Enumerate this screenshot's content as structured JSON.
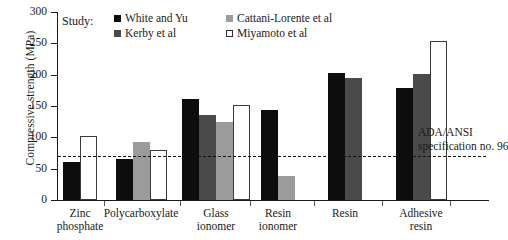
{
  "chart_data": {
    "type": "bar",
    "title": "",
    "xlabel": "",
    "ylabel": "Compressive strength (MPa)",
    "ylim": [
      0,
      300
    ],
    "yticks": [
      0,
      50,
      100,
      150,
      200,
      250,
      300
    ],
    "grid": false,
    "legend_position": "top-left-inside",
    "legend_title": "Study:",
    "categories": [
      "Zinc phosphate",
      "Polycarboxylate",
      "Glass ionomer",
      "Resin ionomer",
      "Resin",
      "Adhesive resin"
    ],
    "series": [
      {
        "name": "White and Yu",
        "color": "#0d0d0d",
        "values": [
          60,
          65,
          161,
          143,
          203,
          179
        ]
      },
      {
        "name": "Kerby et al",
        "color": "#4a4a4a",
        "values": [
          null,
          null,
          135,
          null,
          195,
          201
        ]
      },
      {
        "name": "Cattani-Lorente et al",
        "color": "#9b9b9b",
        "values": [
          null,
          92,
          124,
          38,
          null,
          null
        ]
      },
      {
        "name": "Miyamoto et al",
        "color": "#ffffff",
        "values": [
          102,
          80,
          152,
          null,
          null,
          254
        ]
      }
    ],
    "annotations": [
      {
        "type": "threshold-line",
        "value": 70,
        "style": "dashed",
        "label_line1": "ADA/ANSI",
        "label_line2": "specification no. 96"
      }
    ]
  },
  "axis": {
    "y_title": "Compressive strength (MPa)",
    "y_tick_labels": [
      "300",
      "250",
      "200",
      "150",
      "100",
      "50",
      "0"
    ]
  },
  "legend": {
    "title": "Study:",
    "entries": [
      {
        "label": "White and Yu"
      },
      {
        "label": "Cattani-Lorente et al"
      },
      {
        "label": "Kerby et al"
      },
      {
        "label": "Miyamoto et al"
      }
    ]
  },
  "categories": [
    {
      "line1": "Zinc",
      "line2": "phosphate"
    },
    {
      "line1": "Polycarboxylate",
      "line2": ""
    },
    {
      "line1": "Glass",
      "line2": "ionomer"
    },
    {
      "line1": "Resin",
      "line2": "ionomer"
    },
    {
      "line1": "Resin",
      "line2": ""
    },
    {
      "line1": "Adhesive",
      "line2": "resin"
    }
  ],
  "threshold": {
    "line1": "ADA/ANSI",
    "line2": "specification no. 96"
  }
}
